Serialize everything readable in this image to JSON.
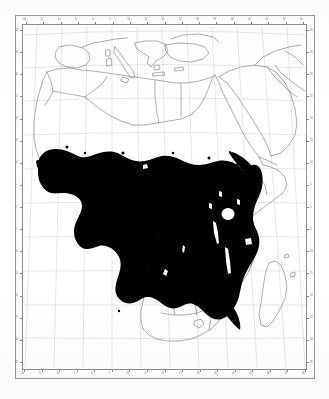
{
  "figure": {
    "kind": "distribution-map",
    "region": "Africa",
    "projection": "conic",
    "shading_color": "#000000",
    "coastline_color": "#5a5a5a",
    "graticule_color": "#c8c8c8",
    "frame_color": "#8d8d8d",
    "background_color": "#ffffff"
  },
  "axes": {
    "top_labels": [
      "20",
      "10",
      "0",
      "10",
      "20",
      "30",
      "40",
      "50",
      "60"
    ],
    "bottom_labels": [
      "20",
      "10",
      "0",
      "10",
      "20",
      "30",
      "40",
      "50",
      "60"
    ],
    "left_labels": [
      "40",
      "30",
      "20",
      "10",
      "0",
      "10",
      "20",
      "30"
    ],
    "right_labels": [
      "40",
      "30",
      "20",
      "10",
      "0",
      "10",
      "20",
      "30"
    ],
    "lon_ticks_dense": [
      "20",
      "15",
      "10",
      "5",
      "0",
      "5",
      "10",
      "15",
      "20",
      "25",
      "30",
      "35",
      "40",
      "45",
      "50",
      "55",
      "60"
    ],
    "lat_ticks_dense": [
      "40",
      "35",
      "30",
      "25",
      "20",
      "15",
      "10",
      "5",
      "0",
      "5",
      "10",
      "15",
      "20",
      "25",
      "30",
      "35"
    ],
    "grid_interval_degrees": "10"
  },
  "chart_data": {
    "type": "map",
    "title": "",
    "xlabel": "",
    "ylabel": "",
    "grid": true,
    "legend": "none",
    "xlim": [
      -22,
      62
    ],
    "ylim": [
      -38,
      42
    ],
    "shaded_area_label": "distribution range",
    "shaded_regions": [
      "West Africa",
      "Guinea coast",
      "Sahel belt",
      "Central Africa",
      "Congo Basin",
      "East Africa",
      "Southern savanna"
    ],
    "unshaded_regions": [
      "Sahara",
      "North Africa",
      "Arabian Peninsula",
      "Horn of Africa",
      "Southern Africa",
      "Madagascar",
      "Southern Europe"
    ],
    "inclusions": [
      "Lake Victoria",
      "Lake Tanganyika",
      "Lake Malawi"
    ]
  }
}
